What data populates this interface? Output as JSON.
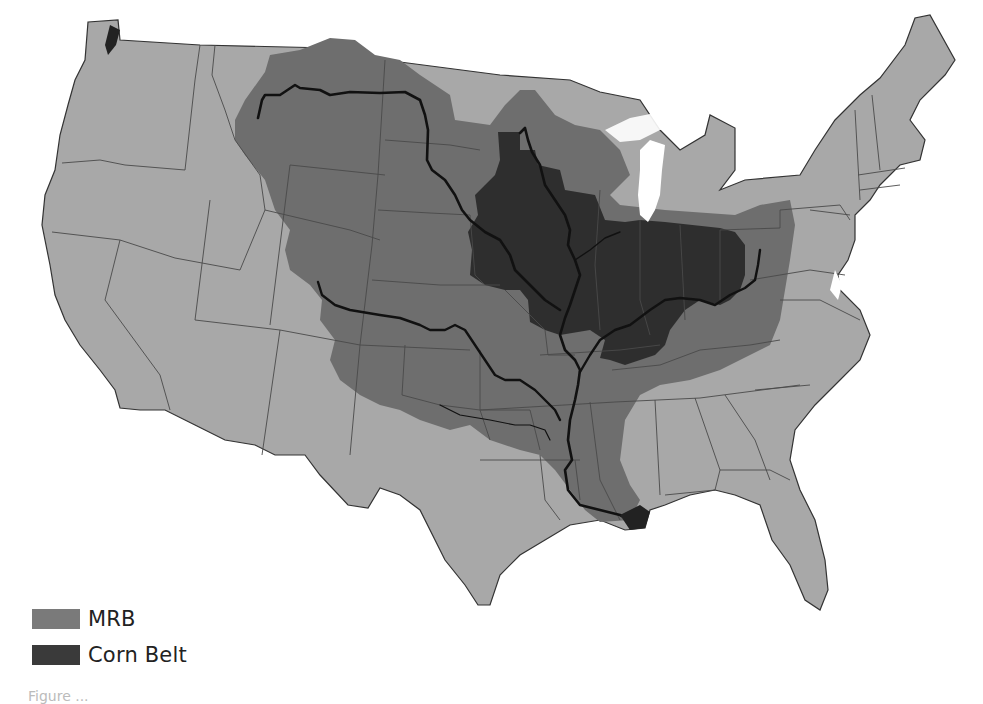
{
  "figure": {
    "type": "map"
  },
  "colors": {
    "background": "#ffffff",
    "us_land": "#a8a8a8",
    "mrb": "#6e6e6e",
    "corn_belt": "#2e2e2e",
    "state_borders": "#4a4a4a",
    "rivers": "#111111",
    "lakes": "#ffffff"
  },
  "legend": {
    "items": [
      {
        "label": "MRB",
        "color": "#7a7a7a"
      },
      {
        "label": "Corn Belt",
        "color": "#3a3a3a"
      }
    ]
  },
  "caption": {
    "text": "Figure ..."
  }
}
